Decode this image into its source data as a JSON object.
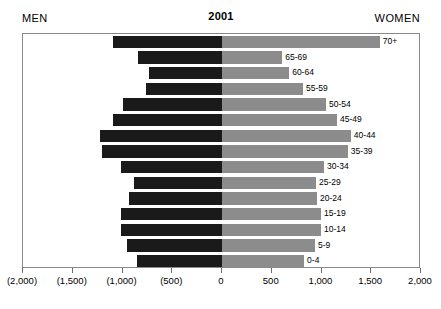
{
  "header": {
    "men_label": "MEN",
    "title": "2001",
    "women_label": "WOMEN"
  },
  "axis": {
    "tick_labels": [
      "(2,000)",
      "(1,500)",
      "(1,000)",
      "(500)",
      "0",
      "500",
      "1,000",
      "1,500",
      "2,000"
    ],
    "tick_values": [
      -2000,
      -1500,
      -1000,
      -500,
      0,
      500,
      1000,
      1500,
      2000
    ]
  },
  "colors": {
    "men_bar": "#1a1a1a",
    "women_bar": "#8c8c8c",
    "frame": "#8a8a8a",
    "background": "#ffffff"
  },
  "chart_data": {
    "type": "bar",
    "title": "2001",
    "xlabel": "",
    "ylabel": "",
    "xlim": [
      -2000,
      2000
    ],
    "grid": false,
    "orientation": "horizontal",
    "subtype": "population-pyramid",
    "categories": [
      "70+",
      "65-69",
      "60-64",
      "55-59",
      "50-54",
      "45-49",
      "40-44",
      "35-39",
      "30-34",
      "25-29",
      "20-24",
      "15-19",
      "10-14",
      "5-9",
      "0-4"
    ],
    "series": [
      {
        "name": "MEN",
        "side": "left",
        "color": "#1a1a1a",
        "values": [
          -1100,
          -840,
          -730,
          -765,
          -995,
          -1095,
          -1225,
          -1205,
          -1015,
          -880,
          -935,
          -1015,
          -1015,
          -955,
          -855
        ]
      },
      {
        "name": "WOMEN",
        "side": "right",
        "color": "#8c8c8c",
        "values": [
          1585,
          605,
          675,
          815,
          1045,
          1155,
          1295,
          1265,
          1025,
          945,
          955,
          995,
          995,
          935,
          825
        ]
      }
    ],
    "labels": [
      "70+",
      "65-69",
      "60-64",
      "55-59",
      "50-54",
      "45-49",
      "40-44",
      "35-39",
      "30-34",
      "25-29",
      "20-24",
      "15-19",
      "10-14",
      "5-9",
      "0-4"
    ]
  }
}
